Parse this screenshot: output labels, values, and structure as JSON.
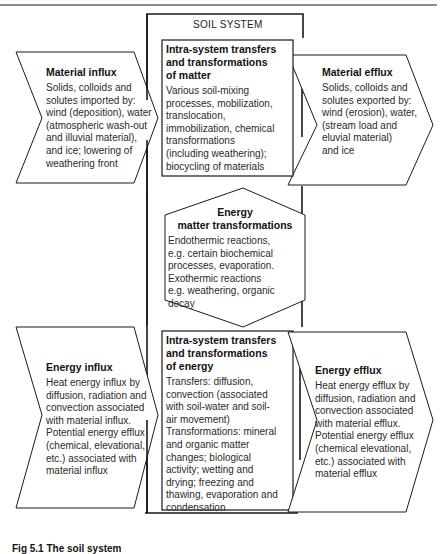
{
  "diagram": {
    "system_label": "SOIL SYSTEM",
    "material_influx": {
      "title": "Material influx",
      "body": "Solids, colloids and\nsolutes imported by:\nwind (deposition), water\n(atmospheric wash-out\nand illuvial material),\nand ice; lowering of\nweathering front"
    },
    "matter_transfers": {
      "title": "Intra-system transfers\nand transformations\nof matter",
      "body": "Various soil-mixing\nprocesses, mobilization,\ntranslocation,\nimmobilization, chemical\ntransformations\n(including weathering);\nbiocycling of materials"
    },
    "material_efflux": {
      "title": "Material efflux",
      "body": "Solids, colloids and\nsolutes exported by:\nwind (erosion), water,\n(stream load and\neluvial material)\nand ice"
    },
    "energy_matter": {
      "title": "Energy\nmatter transformations",
      "body": "Endothermic reactions,\ne.g. certain biochemical\nprocesses, evaporation.\nExothermic reactions\ne.g. weathering, organic\ndecay"
    },
    "energy_influx": {
      "title": "Energy influx",
      "body": "Heat energy influx by\ndiffusion, radiation and\nconvection associated\nwith material influx.\nPotential energy efflux\n(chemical, elevational,\netc.) associated with\nmaterial influx"
    },
    "energy_transfers": {
      "title": "Intra-system transfers\nand transformations\nof energy",
      "body": "Transfers: diffusion,\nconvection (associated\nwith soil-water and soil-\nair movement)\nTransformations: mineral\nand organic matter\nchanges; biological\nactivity; wetting and\ndrying; freezing and\nthawing, evaporation and\ncondensation"
    },
    "energy_efflux": {
      "title": "Energy efflux",
      "body": "Heat energy efflux by\ndiffusion, radiation and\nconvection associated\nwith material efflux.\nPotential energy efflux\n(chemical elevational,\netc.) associated with\nmaterial efflux"
    },
    "caption": "Fig 5.1 The soil system"
  },
  "colors": {
    "line": "#1a1a1a",
    "text": "#2a2a2a",
    "background": "#ffffff"
  }
}
